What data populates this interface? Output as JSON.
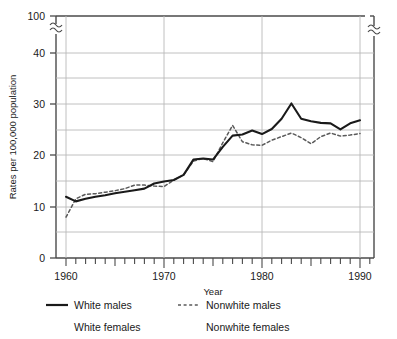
{
  "chart_data": {
    "type": "line",
    "title": "",
    "xlabel": "Year",
    "ylabel": "Rates per 100,000 population",
    "xlim": [
      1959,
      1992
    ],
    "ylim": [
      0,
      45
    ],
    "ytick_labels": [
      "0",
      "10",
      "20",
      "30",
      "40",
      "100"
    ],
    "ytick_values": [
      0,
      10,
      20,
      30,
      40,
      45
    ],
    "y_axis_break": true,
    "y_axis_break_note": "axis broken between 40 and 100",
    "x_axis_break": true,
    "xtick_labels": [
      "1960",
      "1970",
      "1980",
      "1990"
    ],
    "xtick_values": [
      1960,
      1970,
      1980,
      1990
    ],
    "minor_xticks_every": 1,
    "gridlines": "horizontal every 5 units; vertical at labeled decades",
    "legend_position": "below-axes",
    "series": [
      {
        "name": "White males",
        "style": "solid",
        "color": "#1a1a1a",
        "x": [
          1960,
          1961,
          1962,
          1963,
          1964,
          1965,
          1966,
          1967,
          1968,
          1969,
          1970,
          1971,
          1972,
          1973,
          1974,
          1975,
          1976,
          1977,
          1978,
          1979,
          1980,
          1981,
          1982,
          1983,
          1984,
          1985,
          1986,
          1987,
          1988,
          1989,
          1990
        ],
        "values": [
          12.0,
          11.1,
          11.6,
          12.0,
          12.3,
          12.7,
          13.0,
          13.3,
          13.6,
          14.6,
          15.0,
          15.3,
          16.3,
          19.3,
          19.5,
          19.3,
          21.8,
          24.0,
          24.2,
          25.0,
          24.3,
          25.3,
          27.3,
          30.3,
          27.3,
          26.8,
          26.5,
          26.4,
          25.2,
          26.4,
          27.0
        ]
      },
      {
        "name": "Nonwhite males",
        "style": "dashed",
        "color": "#5a5a5a",
        "x": [
          1960,
          1961,
          1962,
          1963,
          1964,
          1965,
          1966,
          1967,
          1968,
          1969,
          1970,
          1971,
          1972,
          1973,
          1974,
          1975,
          1976,
          1977,
          1978,
          1979,
          1980,
          1981,
          1982,
          1983,
          1984,
          1985,
          1986,
          1987,
          1988,
          1989,
          1990
        ],
        "values": [
          8.0,
          11.6,
          12.5,
          12.6,
          12.9,
          13.2,
          13.6,
          14.3,
          14.3,
          14.1,
          14.0,
          15.3,
          16.3,
          19.0,
          19.5,
          18.9,
          22.6,
          26.0,
          22.8,
          22.2,
          22.1,
          23.1,
          23.8,
          24.5,
          23.6,
          22.4,
          23.8,
          24.5,
          23.9,
          24.1,
          24.4
        ]
      },
      {
        "name": "White females",
        "style": "none",
        "color": "#1a1a1a",
        "x": [],
        "values": []
      },
      {
        "name": "Nonwhite females",
        "style": "none",
        "color": "#5a5a5a",
        "x": [],
        "values": []
      }
    ],
    "note_series_drawn": [
      "White males",
      "Nonwhite males"
    ]
  },
  "axes": {
    "ylabel": "Rates per 100,000 population",
    "xlabel": "Year",
    "yticks": [
      {
        "label": "100"
      },
      {
        "label": "40"
      },
      {
        "label": "30"
      },
      {
        "label": "20"
      },
      {
        "label": "10"
      },
      {
        "label": "0"
      }
    ],
    "xticks": [
      {
        "label": "1960"
      },
      {
        "label": "1970"
      },
      {
        "label": "1980"
      },
      {
        "label": "1990"
      }
    ]
  },
  "legend": {
    "entries": [
      {
        "label": "White males",
        "style": "solid",
        "swatch": true
      },
      {
        "label": "Nonwhite males",
        "style": "dashed",
        "swatch": true
      },
      {
        "label": "White females",
        "style": "none",
        "swatch": false
      },
      {
        "label": "Nonwhite females",
        "style": "none",
        "swatch": false
      }
    ]
  },
  "colors": {
    "ink": "#1a1a1a",
    "grid": "#b8b8b8",
    "dashed": "#5a5a5a",
    "frame": "#4a4a4a",
    "background": "#ffffff"
  }
}
